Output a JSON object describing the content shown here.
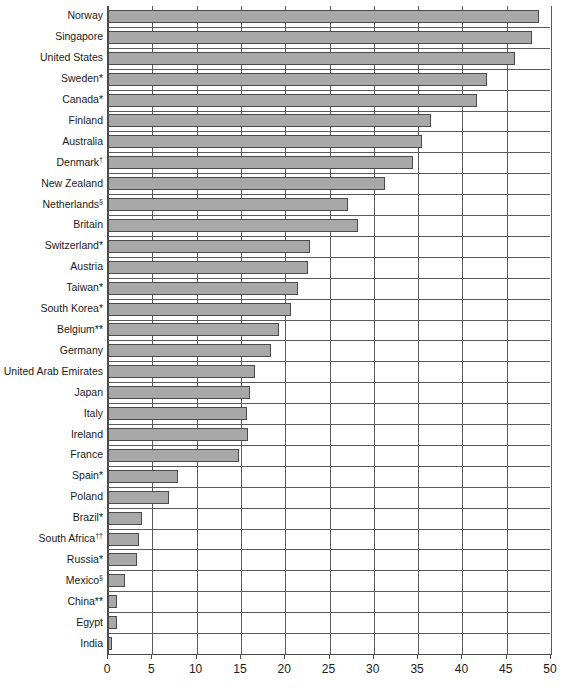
{
  "chart_data": {
    "type": "bar",
    "orientation": "horizontal",
    "title": "",
    "subtitle": "",
    "xlabel": "",
    "ylabel": "",
    "xlim": [
      0,
      50
    ],
    "xticks": [
      0,
      5,
      10,
      15,
      20,
      25,
      30,
      35,
      40,
      45,
      50
    ],
    "xtick_labels": [
      "0",
      "5",
      "10",
      "15",
      "20",
      "25",
      "30",
      "35",
      "40",
      "45",
      "50"
    ],
    "grid": "vertical-and-row-separators",
    "legend": "none",
    "bar_color": "#a8a8a8",
    "bar_edge_color": "#4a4a4a",
    "grid_color": "#5a5a5a",
    "categories": [
      "Norway",
      "Singapore",
      "United States",
      "Sweden*",
      "Canada*",
      "Finland",
      "Australia",
      "Denmark†",
      "New Zealand",
      "Netherlands§",
      "Britain",
      "Switzerland*",
      "Austria",
      "Taiwan*",
      "South Korea*",
      "Belgium**",
      "Germany",
      "United Arab Emirates",
      "Japan",
      "Italy",
      "Ireland",
      "France",
      "Spain*",
      "Poland",
      "Brazil*",
      "South Africa††",
      "Russia*",
      "Mexico§",
      "China**",
      "Egypt",
      "India"
    ],
    "category_labels": [
      {
        "text": "Norway",
        "sup": ""
      },
      {
        "text": "Singapore",
        "sup": ""
      },
      {
        "text": "United States",
        "sup": ""
      },
      {
        "text": "Sweden*",
        "sup": ""
      },
      {
        "text": "Canada*",
        "sup": ""
      },
      {
        "text": "Finland",
        "sup": ""
      },
      {
        "text": "Australia",
        "sup": ""
      },
      {
        "text": "Denmark",
        "sup": "†"
      },
      {
        "text": "New Zealand",
        "sup": ""
      },
      {
        "text": "Netherlands",
        "sup": "§"
      },
      {
        "text": "Britain",
        "sup": ""
      },
      {
        "text": "Switzerland*",
        "sup": ""
      },
      {
        "text": "Austria",
        "sup": ""
      },
      {
        "text": "Taiwan*",
        "sup": ""
      },
      {
        "text": "South Korea*",
        "sup": ""
      },
      {
        "text": "Belgium**",
        "sup": ""
      },
      {
        "text": "Germany",
        "sup": ""
      },
      {
        "text": "United Arab Emirates",
        "sup": ""
      },
      {
        "text": "Japan",
        "sup": ""
      },
      {
        "text": "Italy",
        "sup": ""
      },
      {
        "text": "Ireland",
        "sup": ""
      },
      {
        "text": "France",
        "sup": ""
      },
      {
        "text": "Spain*",
        "sup": ""
      },
      {
        "text": "Poland",
        "sup": ""
      },
      {
        "text": "Brazil*",
        "sup": ""
      },
      {
        "text": "South Africa",
        "sup": "††"
      },
      {
        "text": "Russia*",
        "sup": ""
      },
      {
        "text": "Mexico",
        "sup": "§"
      },
      {
        "text": "China**",
        "sup": ""
      },
      {
        "text": "Egypt",
        "sup": ""
      },
      {
        "text": "India",
        "sup": ""
      }
    ],
    "values": [
      48.6,
      47.9,
      45.9,
      42.8,
      41.7,
      36.4,
      35.4,
      34.4,
      31.3,
      27.1,
      28.2,
      22.8,
      22.6,
      21.4,
      20.7,
      19.3,
      18.4,
      16.6,
      16.0,
      15.7,
      15.8,
      14.8,
      7.9,
      6.9,
      3.8,
      3.5,
      3.3,
      1.9,
      1.0,
      1.0,
      0.5
    ]
  }
}
